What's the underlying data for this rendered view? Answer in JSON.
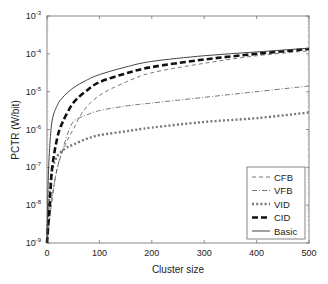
{
  "chart_data": {
    "type": "line",
    "title": "",
    "xlabel": "Cluster size",
    "ylabel": "PCTR (W/bit)",
    "xscale": "linear",
    "yscale": "log",
    "xlim": [
      0,
      500
    ],
    "ylim": [
      1e-09,
      0.001
    ],
    "xticks": [
      0,
      100,
      200,
      300,
      400,
      500
    ],
    "xtick_labels": [
      "0",
      "100",
      "200",
      "300",
      "400",
      "500"
    ],
    "yticks_exp": [
      -3,
      -4,
      -5,
      -6,
      -7,
      -8,
      -9
    ],
    "ytick_base": "10",
    "grid": false,
    "legend_position": "lower right",
    "series": [
      {
        "name": "CFB",
        "style": "dashed-thin",
        "x": [
          0,
          10,
          20,
          35,
          50,
          70,
          100,
          150,
          200,
          300,
          400,
          500
        ],
        "log10_y": [
          -9,
          -7.8,
          -7.0,
          -6.4,
          -6.0,
          -5.5,
          -5.1,
          -4.75,
          -4.5,
          -4.25,
          -4.05,
          -3.92
        ]
      },
      {
        "name": "VFB",
        "style": "dashdot-thin",
        "x": [
          0,
          10,
          20,
          35,
          50,
          75,
          100,
          150,
          200,
          300,
          400,
          500
        ],
        "log10_y": [
          -9,
          -7.8,
          -7.0,
          -6.3,
          -5.8,
          -5.62,
          -5.5,
          -5.38,
          -5.3,
          -5.15,
          -5.0,
          -4.85
        ]
      },
      {
        "name": "VID",
        "style": "dotted-thick",
        "x": [
          0,
          3,
          6,
          10,
          20,
          35,
          50,
          75,
          100,
          150,
          200,
          300,
          400,
          500
        ],
        "log10_y": [
          -9,
          -8.0,
          -7.5,
          -7.05,
          -6.7,
          -6.5,
          -6.4,
          -6.25,
          -6.15,
          -6.05,
          -5.95,
          -5.8,
          -5.7,
          -5.55
        ]
      },
      {
        "name": "CID",
        "style": "dashed-thick",
        "x": [
          0,
          5,
          10,
          20,
          30,
          50,
          75,
          100,
          150,
          200,
          300,
          400,
          500
        ],
        "log10_y": [
          -9,
          -8.0,
          -7.0,
          -6.2,
          -5.8,
          -5.3,
          -4.98,
          -4.75,
          -4.52,
          -4.35,
          -4.15,
          -4.0,
          -3.87
        ]
      },
      {
        "name": "Basic",
        "style": "solid-thin",
        "x": [
          0,
          2,
          5,
          10,
          20,
          30,
          50,
          75,
          100,
          150,
          200,
          300,
          400,
          500
        ],
        "log10_y": [
          -9,
          -7.5,
          -6.5,
          -5.75,
          -5.35,
          -5.15,
          -4.9,
          -4.7,
          -4.55,
          -4.35,
          -4.2,
          -4.05,
          -3.95,
          -3.85
        ]
      }
    ]
  }
}
